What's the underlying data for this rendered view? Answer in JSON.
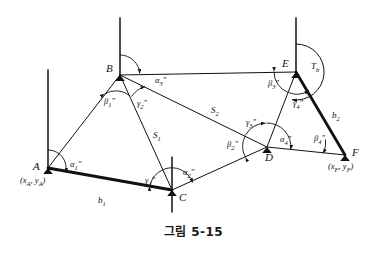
{
  "figure": {
    "caption": "그림 5-15",
    "caption_number": "5-15",
    "type": "surveying-traverse-diagram",
    "ink_color": "#111111",
    "background_color": "#ffffff"
  },
  "points": [
    {
      "id": "A",
      "label": "A",
      "x": 48,
      "y": 168,
      "coord_label": "(xₐ, yₐ)",
      "has_meridian": true
    },
    {
      "id": "B",
      "label": "B",
      "x": 120,
      "y": 75,
      "coord_label": "",
      "has_meridian": true
    },
    {
      "id": "C",
      "label": "C",
      "x": 172,
      "y": 190,
      "coord_label": "",
      "has_meridian": true
    },
    {
      "id": "D",
      "label": "D",
      "x": 267,
      "y": 147,
      "coord_label": "",
      "has_meridian": false
    },
    {
      "id": "E",
      "label": "E",
      "x": 296,
      "y": 72,
      "coord_label": "",
      "has_meridian": true
    },
    {
      "id": "F",
      "label": "F",
      "x": 345,
      "y": 155,
      "coord_label": "(xᶠ, yᶠ)",
      "has_meridian": false
    }
  ],
  "point_labels": {
    "A": "A",
    "B": "B",
    "C": "C",
    "D": "D",
    "E": "E",
    "F": "F"
  },
  "coordinate_labels": {
    "A": "(x",
    "A_sub1": "A",
    "A_mid": ", y",
    "A_sub2": "A",
    "A_end": ")",
    "F": "(x",
    "F_sub1": "F",
    "F_mid": ", y",
    "F_sub2": "F",
    "F_end": ")"
  },
  "sides": [
    {
      "name": "b1",
      "label": "b",
      "sub": "1",
      "from": "A",
      "to": "C",
      "weight": "thick",
      "arrow": true
    },
    {
      "name": "b2",
      "label": "b",
      "sub": "2",
      "from": "E",
      "to": "F",
      "weight": "thick",
      "arrow": true
    },
    {
      "name": "S1",
      "label": "S",
      "sub": "1",
      "from": "B",
      "to": "C",
      "weight": "thin",
      "arrow": false
    },
    {
      "name": "S2",
      "label": "S",
      "sub": "2",
      "from": "B",
      "to": "D",
      "weight": "thin",
      "arrow": false
    },
    {
      "name": "AB",
      "label": "",
      "sub": "",
      "from": "A",
      "to": "B",
      "weight": "thin",
      "arrow": false
    },
    {
      "name": "BE",
      "label": "",
      "sub": "",
      "from": "B",
      "to": "E",
      "weight": "thin",
      "arrow": false
    },
    {
      "name": "CD",
      "label": "",
      "sub": "",
      "from": "C",
      "to": "D",
      "weight": "thin",
      "arrow": false
    },
    {
      "name": "DE",
      "label": "",
      "sub": "",
      "from": "D",
      "to": "E",
      "weight": "thin",
      "arrow": false
    },
    {
      "name": "DF",
      "label": "",
      "sub": "",
      "from": "D",
      "to": "F",
      "weight": "thin",
      "arrow": false
    }
  ],
  "side_labels": [
    {
      "name": "b1-label",
      "text": "b",
      "sub": "1",
      "x": 98,
      "y": 196
    },
    {
      "name": "b2-label",
      "text": "b",
      "sub": "2",
      "x": 332,
      "y": 111
    },
    {
      "name": "S1-label",
      "text": "S",
      "sub": "1",
      "x": 153,
      "y": 131
    },
    {
      "name": "S2-label",
      "text": "S",
      "sub": "2",
      "x": 211,
      "y": 106
    }
  ],
  "angles": [
    {
      "name": "alpha-1",
      "greek": "α",
      "sub": "1",
      "marks": "″",
      "at": "A",
      "x": 70,
      "y": 165
    },
    {
      "name": "beta-1",
      "greek": "β",
      "sub": "1",
      "marks": "″",
      "at": "B",
      "x": 109,
      "y": 101
    },
    {
      "name": "gamma-2",
      "greek": "γ",
      "sub": "2",
      "marks": "″",
      "at": "B",
      "x": 139,
      "y": 103
    },
    {
      "name": "alpha-3",
      "greek": "α",
      "sub": "3",
      "marks": "″",
      "at": "B",
      "x": 157,
      "y": 82
    },
    {
      "name": "gamma-1",
      "greek": "γ",
      "sub": "1",
      "marks": "″",
      "at": "C",
      "x": 147,
      "y": 181
    },
    {
      "name": "alpha-2",
      "greek": "α",
      "sub": "2",
      "marks": "″",
      "at": "C",
      "x": 185,
      "y": 173
    },
    {
      "name": "beta-2",
      "greek": "β",
      "sub": "2",
      "marks": "″",
      "at": "D",
      "x": 230,
      "y": 145
    },
    {
      "name": "gamma-3",
      "greek": "γ",
      "sub": "3",
      "marks": "″",
      "at": "D",
      "x": 250,
      "y": 124
    },
    {
      "name": "alpha-4",
      "greek": "α",
      "sub": "4",
      "marks": "″",
      "at": "D",
      "x": 283,
      "y": 140
    },
    {
      "name": "beta-3",
      "greek": "β",
      "sub": "3",
      "marks": "″",
      "at": "E",
      "x": 273,
      "y": 84
    },
    {
      "name": "gamma-4",
      "greek": "γ",
      "sub": "4",
      "marks": "″",
      "at": "E",
      "x": 296,
      "y": 103
    },
    {
      "name": "beta-4",
      "greek": "β",
      "sub": "4",
      "marks": "″",
      "at": "F",
      "x": 317,
      "y": 140
    }
  ],
  "bearing": {
    "name": "T-b",
    "label": "T",
    "sub": "b",
    "x": 311,
    "y": 66,
    "description": "azimuth arc at E"
  },
  "meridians": [
    {
      "at": "A",
      "x": 48,
      "top": 70,
      "bottom": 170
    },
    {
      "at": "B",
      "x": 120,
      "top": 18,
      "bottom": 78
    },
    {
      "at": "C",
      "x": 172,
      "top": 157,
      "bottom": 212
    },
    {
      "at": "E",
      "x": 296,
      "top": 18,
      "bottom": 76
    }
  ]
}
